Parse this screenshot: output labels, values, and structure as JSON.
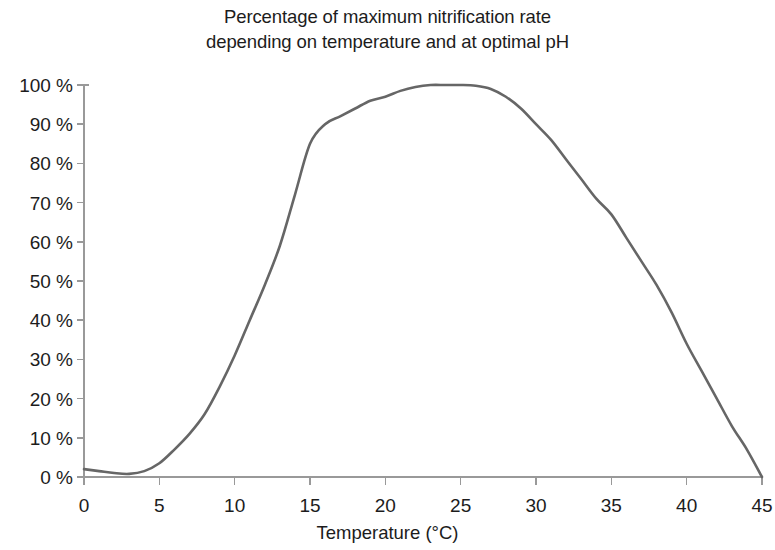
{
  "chart_data": {
    "type": "line",
    "title": "Percentage of maximum nitrification rate depending on temperature and at optimal pH",
    "title_lines": [
      "Percentage of maximum nitrification rate",
      "depending on temperature and at optimal pH"
    ],
    "xlabel": "Temperature (°C)",
    "ylabel": "",
    "xlim": [
      0,
      45
    ],
    "ylim": [
      0,
      100
    ],
    "grid": false,
    "legend": null,
    "line_color": "#666666",
    "axis_color": "#999999",
    "x_ticks": [
      0,
      5,
      10,
      15,
      20,
      25,
      30,
      35,
      40,
      45
    ],
    "x_tick_labels": [
      "0",
      "5",
      "10",
      "15",
      "20",
      "25",
      "30",
      "35",
      "40",
      "45"
    ],
    "y_ticks": [
      0,
      10,
      20,
      30,
      40,
      50,
      60,
      70,
      80,
      90,
      100
    ],
    "y_tick_labels": [
      "0 %",
      "10 %",
      "20 %",
      "30 %",
      "40 %",
      "50 %",
      "60 %",
      "70 %",
      "80 %",
      "90 %",
      "100 %"
    ],
    "series": [
      {
        "name": "Nitrification rate",
        "x": [
          0,
          1,
          2,
          3,
          4,
          5,
          6,
          7,
          8,
          9,
          10,
          11,
          12,
          13,
          14,
          15,
          16,
          17,
          18,
          19,
          20,
          21,
          22,
          23,
          24,
          25,
          26,
          27,
          28,
          29,
          30,
          31,
          32,
          33,
          34,
          35,
          36,
          37,
          38,
          39,
          40,
          41,
          42,
          43,
          44,
          45
        ],
        "values": [
          2,
          1.5,
          1,
          0.8,
          1.5,
          3.5,
          7,
          11,
          16,
          23,
          31,
          40,
          49,
          59,
          72,
          85,
          90,
          92,
          94,
          96,
          97,
          98.5,
          99.5,
          100,
          100,
          100,
          99.8,
          99,
          97,
          94,
          90,
          86,
          81,
          76,
          71,
          67,
          61,
          55,
          49,
          42,
          34,
          27,
          20,
          13,
          7,
          0
        ]
      }
    ]
  },
  "axis_geometry": {
    "left_px": 84,
    "right_px": 762,
    "top_px": 85,
    "bottom_px": 477
  }
}
